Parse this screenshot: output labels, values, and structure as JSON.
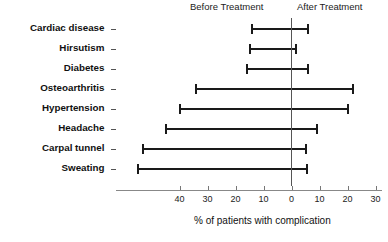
{
  "chart_data": {
    "type": "bar",
    "title": "",
    "subtitle": "",
    "xlabel": "% of patients with complication",
    "ylabel": "",
    "orientation": "horizontal",
    "style": "paired-range-bars-around-zero",
    "zero_axis_label": "0",
    "xlim": [
      -45,
      32
    ],
    "x_tick_values": [
      -40,
      -30,
      -20,
      -10,
      0,
      10,
      20,
      30
    ],
    "x_tick_labels": [
      "40",
      "30",
      "20",
      "10",
      "0",
      "10",
      "20",
      "30"
    ],
    "grid": false,
    "legend_position": "top",
    "group_headers": {
      "left": "Before Treatment",
      "right": "After Treatment"
    },
    "categories": [
      "Cardiac disease",
      "Hirsutism",
      "Diabetes",
      "Osteoarthritis",
      "Hypertension",
      "Headache",
      "Carpal tunnel",
      "Sweating"
    ],
    "series": [
      {
        "name": "Before Treatment",
        "side": "left",
        "values": [
          14,
          15,
          16,
          34,
          40,
          45,
          53,
          55
        ]
      },
      {
        "name": "After Treatment",
        "side": "right",
        "values": [
          6,
          1.5,
          6,
          22,
          20,
          9,
          5,
          5.5
        ]
      }
    ],
    "colors": {
      "bar": "#1a1a1a",
      "axis": "#555555",
      "tick": "#777777",
      "background": "#ffffff",
      "text": "#111111"
    }
  }
}
